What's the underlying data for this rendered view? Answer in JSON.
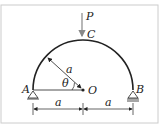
{
  "diagram": {
    "type": "semicircular-arch",
    "labels": {
      "load": "P",
      "top": "C",
      "left_support": "A",
      "right_support": "B",
      "center": "O",
      "radius": "a",
      "angle": "θ",
      "dim_left": "a",
      "dim_right": "a"
    },
    "colors": {
      "line": "#222222",
      "arrow": "#888888",
      "frame": "#cccccc"
    }
  }
}
